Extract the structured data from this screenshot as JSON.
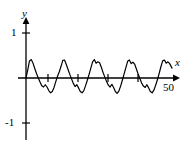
{
  "figure": {
    "name": "periodic-waveform-plot",
    "background": "#ffffff",
    "stroke_color": "#000000",
    "width": 191,
    "height": 148
  },
  "axes": {
    "x_label": "x",
    "y_label": "y",
    "origin_px": {
      "x": 26,
      "y": 78
    },
    "x_axis_start_px": 18,
    "x_axis_end_px": 179,
    "y_axis_top_px": 18,
    "y_axis_bottom_px": 140,
    "unit_y_px": 45,
    "x_ticks": [
      {
        "label": "",
        "px": 48
      },
      {
        "label": "",
        "px": 78
      },
      {
        "label": "",
        "px": 108
      },
      {
        "label": "",
        "px": 138
      }
    ],
    "y_ticks": [
      {
        "label": "1",
        "value": 1,
        "px": 33
      },
      {
        "label": "",
        "value": 0,
        "px": 78
      },
      {
        "label": "-1",
        "value": -1,
        "px": 123
      }
    ],
    "end_label": "50"
  },
  "labels": {
    "y": "y",
    "x": "x",
    "one": "1",
    "negative_one": "-1",
    "fifty": "50"
  },
  "chart_data": {
    "type": "line",
    "title": "",
    "xlabel": "x",
    "ylabel": "y",
    "xlim": [
      0,
      50
    ],
    "ylim": [
      -1.15,
      1.25
    ],
    "grid": false,
    "legend": false,
    "yticks": [
      -1,
      0,
      1
    ],
    "ytick_labels": [
      "-1",
      "",
      "1"
    ],
    "xticks": [
      10,
      20,
      30,
      40
    ],
    "xtick_labels": [
      "",
      "",
      "",
      ""
    ],
    "annotations": [
      {
        "text": "50",
        "x": 50,
        "y": -0.22
      }
    ],
    "series": [
      {
        "name": "signal",
        "color": "#000000",
        "linewidth": 1.2,
        "x": [
          0.0,
          0.6,
          1.2,
          1.8,
          2.4,
          3.0,
          3.6,
          4.2,
          4.8,
          5.4,
          6.0,
          6.6,
          7.2,
          7.8,
          8.4,
          9.0,
          9.6,
          10.2,
          10.8,
          11.4,
          12.0,
          12.6,
          13.2,
          13.8,
          14.4,
          15.0,
          15.6,
          16.2,
          16.8,
          17.4,
          18.0,
          18.6,
          19.2,
          19.8,
          20.4,
          21.0,
          21.6,
          22.2,
          22.8,
          23.4,
          24.0,
          24.6,
          25.2,
          25.8,
          26.4,
          27.0,
          27.6,
          28.2,
          28.8,
          29.4,
          30.0,
          30.6,
          31.2,
          31.8,
          32.4,
          33.0,
          33.6,
          34.2,
          34.8,
          35.4,
          36.0,
          36.6,
          37.2,
          37.8,
          38.4,
          39.0,
          39.6,
          40.2,
          40.8,
          41.4,
          42.0,
          42.6,
          43.2,
          43.8,
          44.4,
          45.0,
          45.6,
          46.2,
          46.8,
          47.4,
          48.0,
          48.6,
          49.2,
          50.0
        ],
        "y": [
          0.0,
          0.18,
          0.38,
          0.41,
          0.33,
          0.21,
          0.1,
          0.0,
          -0.09,
          -0.17,
          -0.2,
          -0.15,
          -0.2,
          -0.28,
          -0.33,
          -0.3,
          -0.21,
          -0.08,
          0.04,
          0.14,
          0.26,
          0.39,
          0.4,
          0.3,
          0.19,
          0.08,
          -0.02,
          -0.12,
          -0.19,
          -0.15,
          -0.22,
          -0.3,
          -0.33,
          -0.28,
          -0.17,
          -0.05,
          0.08,
          0.22,
          0.36,
          0.41,
          0.33,
          0.36,
          0.34,
          0.24,
          0.12,
          0.02,
          -0.08,
          -0.16,
          -0.2,
          -0.14,
          -0.21,
          -0.3,
          -0.34,
          -0.29,
          -0.18,
          -0.05,
          0.09,
          0.23,
          0.37,
          0.4,
          0.32,
          0.35,
          0.31,
          0.2,
          0.09,
          -0.01,
          -0.11,
          -0.18,
          -0.21,
          -0.15,
          -0.22,
          -0.3,
          -0.33,
          -0.27,
          -0.16,
          -0.04,
          0.1,
          0.25,
          0.38,
          0.4,
          0.33,
          0.36,
          0.32,
          0.22
        ]
      }
    ]
  }
}
